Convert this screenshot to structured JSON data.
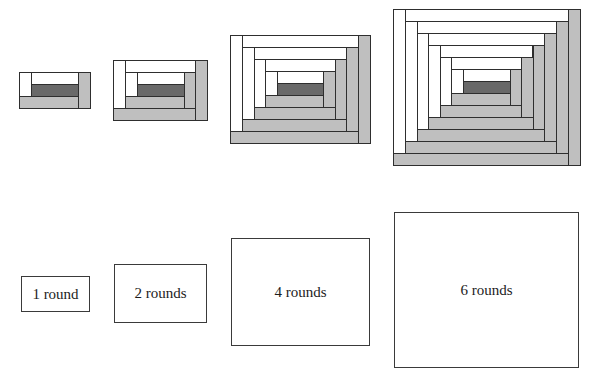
{
  "colors": {
    "white_strip": "#ffffff",
    "gray_strip": "#bfbfbf",
    "center": "#696969",
    "border": "#2e2e2e"
  },
  "strip_size": 12,
  "center_size": {
    "w": 47,
    "h": 12
  },
  "blocks": [
    {
      "rounds": 1,
      "x": 19,
      "y": 72,
      "sx": 12,
      "sy": 12,
      "label": "1 round",
      "box": {
        "x": 21,
        "y": 276,
        "w": 69,
        "h": 36
      }
    },
    {
      "rounds": 2,
      "x": 113,
      "y": 60,
      "sx": 11.75,
      "sy": 12,
      "label": "2 rounds",
      "box": {
        "x": 114,
        "y": 264,
        "w": 93,
        "h": 59
      }
    },
    {
      "rounds": 4,
      "x": 230,
      "y": 35,
      "sx": 11.5,
      "sy": 12,
      "label": "4 rounds",
      "box": {
        "x": 231,
        "y": 238,
        "w": 139,
        "h": 108
      }
    },
    {
      "rounds": 6,
      "x": 393,
      "y": 9,
      "sx": 11.6,
      "sy": 12,
      "label": "6 rounds",
      "box": {
        "x": 394,
        "y": 212,
        "w": 185,
        "h": 156
      }
    }
  ]
}
